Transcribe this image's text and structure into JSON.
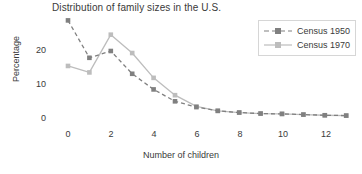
{
  "chart_data": {
    "type": "line",
    "title": "Distribution of family sizes in the U.S.",
    "xlabel": "Number of children",
    "ylabel": "Percentage",
    "x": [
      0,
      1,
      2,
      3,
      4,
      5,
      6,
      7,
      8,
      9,
      10,
      11,
      12,
      13
    ],
    "xlim": [
      -0.6,
      13.6
    ],
    "ylim": [
      -1.5,
      30
    ],
    "xticks": [
      0,
      2,
      4,
      6,
      8,
      10,
      12
    ],
    "xtick_labels": [
      "0",
      "2",
      "4",
      "6",
      "8",
      "10",
      "12"
    ],
    "yticks": [
      0,
      10,
      20
    ],
    "ytick_labels": [
      "0",
      "10",
      "20"
    ],
    "grid": false,
    "legend_position": "upper right",
    "series": [
      {
        "name": "Census 1950",
        "color": "#808080",
        "linestyle": "dashed",
        "marker": "square",
        "values": [
          29.0,
          18.0,
          20.0,
          13.3,
          8.7,
          5.2,
          3.5,
          2.4,
          1.9,
          1.6,
          1.5,
          1.3,
          1.1,
          1.0
        ]
      },
      {
        "name": "Census 1970",
        "color": "#bdbdbd",
        "linestyle": "solid",
        "marker": "square",
        "values": [
          15.6,
          13.7,
          24.8,
          19.4,
          12.1,
          7.0,
          3.7,
          2.4,
          1.9,
          1.6,
          1.5,
          1.3,
          1.1,
          1.0
        ]
      }
    ]
  },
  "legend": {
    "entries": [
      {
        "label": "Census 1950"
      },
      {
        "label": "Census 1970"
      }
    ]
  }
}
